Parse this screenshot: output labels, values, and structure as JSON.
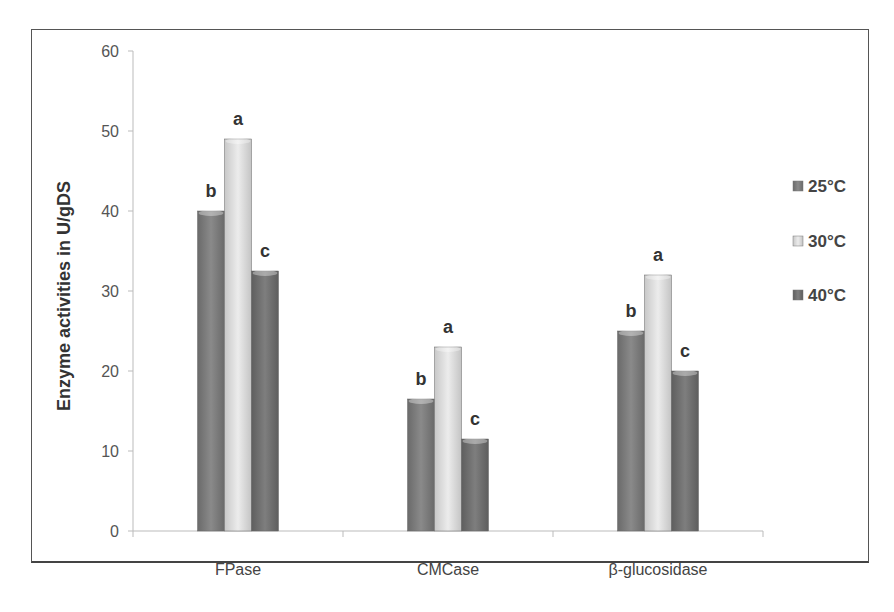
{
  "chart_data": {
    "type": "bar",
    "title": "",
    "xlabel": "",
    "ylabel": "Enzyme activities in U/gDS",
    "ylim": [
      0,
      60
    ],
    "yticks": [
      0,
      10,
      20,
      30,
      40,
      50,
      60
    ],
    "grid": false,
    "legend_position": "right",
    "categories": [
      "FPase",
      "CMCase",
      "β-glucosidase"
    ],
    "series": [
      {
        "name": "25°C",
        "color": "#7a7a7a",
        "values": [
          40,
          16.5,
          25
        ],
        "letters": [
          "b",
          "b",
          "b"
        ]
      },
      {
        "name": "30°C",
        "color": "#d9d9d9",
        "values": [
          49,
          23,
          32
        ],
        "letters": [
          "a",
          "a",
          "a"
        ]
      },
      {
        "name": "40°C",
        "color": "#6f6f6f",
        "values": [
          32.5,
          11.5,
          20
        ],
        "letters": [
          "c",
          "c",
          "c"
        ]
      }
    ]
  },
  "axis": {
    "y_title": "Enzyme activities in U/gDS",
    "y_ticks": [
      "0",
      "10",
      "20",
      "30",
      "40",
      "50",
      "60"
    ],
    "categories": [
      "FPase",
      "CMCase",
      "β-glucosidase"
    ]
  },
  "legend": [
    "25°C",
    "30°C",
    "40°C"
  ]
}
